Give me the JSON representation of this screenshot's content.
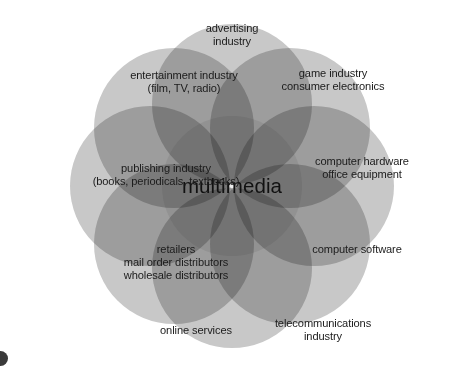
{
  "diagram": {
    "title": "multimedia",
    "center_label": "multimedia",
    "type": "venn-ring",
    "petal_count": 8,
    "colors": {
      "background": "#ffffff",
      "circle_fill": "#c8c8c8",
      "overlap_fill": "#8f8f8f",
      "center_fill": "#eeeeee",
      "text": "#1b1b1b",
      "corner_mark": "#3a3a3a"
    },
    "segments": [
      {
        "id": "advertising",
        "label": "advertising\nindustry",
        "angle_deg": -90,
        "label_x": 232,
        "label_y": 35
      },
      {
        "id": "game-consumer-electronics",
        "label": "game industry\nconsumer electronics",
        "angle_deg": -45,
        "label_x": 333,
        "label_y": 80
      },
      {
        "id": "computer-hardware",
        "label": "computer hardware\noffice equipment",
        "angle_deg": 0,
        "label_x": 362,
        "label_y": 168
      },
      {
        "id": "computer-software",
        "label": "computer software",
        "angle_deg": 45,
        "label_x": 357,
        "label_y": 249
      },
      {
        "id": "telecommunications",
        "label": "telecommunications\nindustry",
        "angle_deg": 90,
        "label_x": 323,
        "label_y": 330
      },
      {
        "id": "online-services",
        "label": "online services",
        "angle_deg": 135,
        "label_x": 196,
        "label_y": 330
      },
      {
        "id": "retailers-distributors",
        "label": "retailers\nmail order distributors\nwholesale distributors",
        "angle_deg": 180,
        "label_x": 176,
        "label_y": 262
      },
      {
        "id": "publishing",
        "label": "publishing industry\n(books, periodicals, textbooks)",
        "angle_deg": -180,
        "label_x": 166,
        "label_y": 175
      },
      {
        "id": "entertainment",
        "label": "entertainment industry\n(film, TV, radio)",
        "angle_deg": -135,
        "label_x": 184,
        "label_y": 82
      }
    ]
  }
}
